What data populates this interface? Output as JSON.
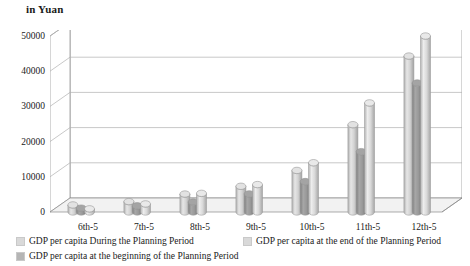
{
  "chart_data": {
    "type": "bar",
    "title": "",
    "unit_label": "in Yuan",
    "xlabel": "",
    "ylabel": "in Yuan",
    "ylim": [
      0,
      50000
    ],
    "yticks": [
      0,
      10000,
      20000,
      30000,
      40000,
      50000
    ],
    "ytick_labels": [
      "0",
      "10000",
      "20000",
      "30000",
      "40000",
      "50000"
    ],
    "grid": true,
    "legend_position": "bottom",
    "three_d": true,
    "bar_shape": "cylinder",
    "categories": [
      "6th-5",
      "7th-5",
      "8th-5",
      "9th-5",
      "10th-5",
      "11th-5",
      "12th-5"
    ],
    "series": [
      {
        "name": "GDP per capita During the Planning Period",
        "color": "#d9d9d9",
        "values": [
          700,
          1650,
          3800,
          6000,
          10500,
          23500,
          43000
        ]
      },
      {
        "name": "GDP per capita at the beginning of the Planning Period",
        "color": "#9e9e9e",
        "values": [
          450,
          1100,
          2200,
          4500,
          8000,
          16500,
          36000
        ]
      },
      {
        "name": "GDP per capita at the end of the Planning Period",
        "color": "#e0e0e0",
        "values": [
          900,
          2300,
          5300,
          7800,
          14000,
          31000,
          50000
        ]
      }
    ],
    "series_draw_order": [
      0,
      1,
      2
    ],
    "legend_entries": [
      {
        "label": "GDP per capita During the Planning Period",
        "color": "#d9d9d9"
      },
      {
        "label": "GDP per capita at the end of the Planning Period",
        "color": "#d9d9d9"
      },
      {
        "label": "GDP per capita at the beginning of the Planning Period",
        "color": "#b5b5b5"
      }
    ],
    "colors": {
      "axis": "#8a8a8a",
      "grid": "#b0b0b0",
      "wall": "#ffffff",
      "floor": "#f2f2f2",
      "text": "#1a1a1a"
    }
  }
}
